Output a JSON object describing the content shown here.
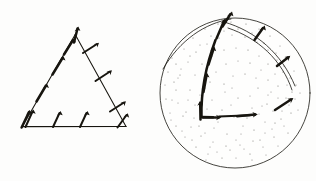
{
  "figure": {
    "title": "",
    "background_color": "#fdfdfc",
    "ink_color": "#17150f",
    "width": 316,
    "height": 181,
    "panels": [
      {
        "name": "triangle-panel",
        "label": "",
        "shape": "triangle",
        "description": "Triangle outline with vector arrows along each of its three edges",
        "vertices": [
          [
            22,
            126
          ],
          [
            75,
            34
          ],
          [
            126,
            126
          ]
        ],
        "edges": [
          {
            "name": "left-edge",
            "from": [
              22,
              126
            ],
            "to": [
              75,
              34
            ],
            "arrow_count": 4,
            "arrow_style": "tangent-thick",
            "direction": "up-right"
          },
          {
            "name": "right-edge",
            "from": [
              75,
              34
            ],
            "to": [
              126,
              126
            ],
            "arrow_count": 3,
            "arrow_style": "normal-thin",
            "direction": "up-right"
          },
          {
            "name": "bottom-edge",
            "from": [
              22,
              126
            ],
            "to": [
              126,
              126
            ],
            "arrow_count": 4,
            "arrow_style": "oblique-thin",
            "direction": "up-right"
          }
        ],
        "apex_arrow": true
      },
      {
        "name": "disk-panel",
        "label": "",
        "shape": "stippled-disk",
        "description": "Stippled circular disk containing a curved path with vector arrows and an outer arc with outward normal arrows",
        "circle": {
          "cx": 235,
          "cy": 93,
          "r": 75
        },
        "stipple": {
          "dot_count": 150,
          "dot_radius": 0.55
        },
        "paths": [
          {
            "name": "inner-corner-path",
            "description": "L-shaped path from corner: vertical segment curving up and horizontal segment to the right",
            "arrow_count": 5,
            "arrow_style": "tangent-thick"
          },
          {
            "name": "outer-arc-path",
            "description": "Arc near the rim with outward-pointing normal arrows",
            "arrow_count": 4,
            "arrow_style": "normal-thick"
          }
        ]
      }
    ]
  }
}
